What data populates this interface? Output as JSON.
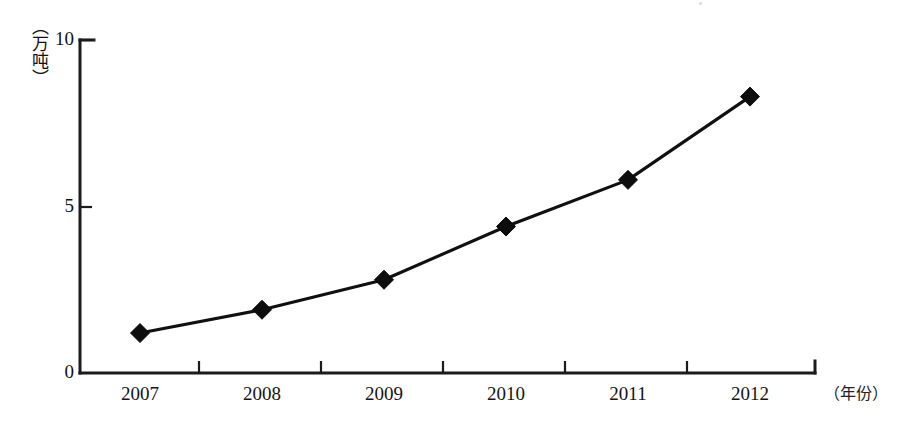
{
  "chart_data": {
    "type": "line",
    "title": "",
    "subtitle": "",
    "xlabel": "（年份）",
    "ylabel": "（万吨）",
    "categories": [
      "2007",
      "2008",
      "2009",
      "2010",
      "2011",
      "2012"
    ],
    "values": [
      1.2,
      1.9,
      2.8,
      4.4,
      5.8,
      8.3
    ],
    "series": [
      {
        "name": "",
        "values": [
          1.2,
          1.9,
          2.8,
          4.4,
          5.8,
          8.3
        ]
      }
    ],
    "ylim": [
      0,
      10
    ],
    "ytick_labels": [
      "0",
      "5",
      "10"
    ],
    "ytick_values": [
      0,
      5,
      10
    ],
    "xtick_labels": [
      "2007",
      "2008",
      "2009",
      "2010",
      "2011",
      "2012"
    ],
    "grid": false,
    "legend": false,
    "legend_position": "none",
    "marker": "diamond",
    "line_color": "#101010",
    "marker_color": "#0d0d0d",
    "axis_color": "#1b1b1b",
    "background_color": "#ffffff",
    "annotations": []
  },
  "axes": {
    "y_unit_label": "（万吨）",
    "x_unit_label": "（年份）",
    "y_ticks": [
      {
        "label": "10",
        "value": 10
      },
      {
        "label": "5",
        "value": 5
      },
      {
        "label": "0",
        "value": 0
      }
    ],
    "x_ticks": [
      {
        "label": "2007"
      },
      {
        "label": "2008"
      },
      {
        "label": "2009"
      },
      {
        "label": "2010"
      },
      {
        "label": "2011"
      },
      {
        "label": "2012"
      }
    ]
  }
}
